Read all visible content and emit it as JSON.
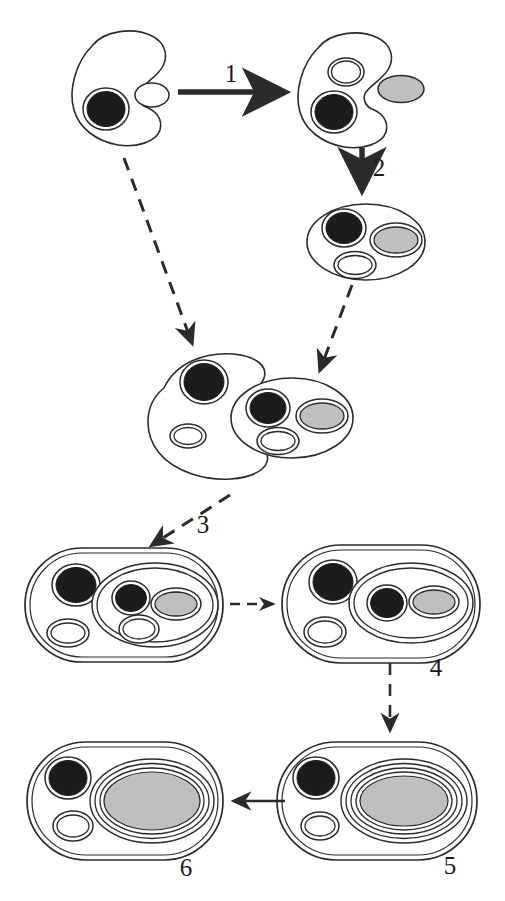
{
  "figure": {
    "background_color": "#ffffff",
    "outline_color": "#2b2b2b",
    "nucleus_color": "#1c1c1c",
    "plastid_color": "#bfbfbf",
    "vesicle_color": "#ffffff",
    "arrow_color": "#2b2b2b"
  },
  "step_labels": [
    {
      "id": "step-1",
      "text": "1",
      "x": 231,
      "y": 82
    },
    {
      "id": "step-2",
      "text": "2",
      "x": 379,
      "y": 176
    },
    {
      "id": "step-3",
      "text": "3",
      "x": 203,
      "y": 533
    },
    {
      "id": "step-4",
      "text": "4",
      "x": 436,
      "y": 676
    },
    {
      "id": "step-5",
      "text": "5",
      "x": 450,
      "y": 874
    },
    {
      "id": "step-6",
      "text": "6",
      "x": 186,
      "y": 876
    }
  ],
  "cells": [
    {
      "id": "cell-host-initial",
      "name": "host-cell-initial",
      "stage": "start",
      "shape": "crescent",
      "organelles": [
        "nucleus-dark",
        "vesicle-white"
      ]
    },
    {
      "id": "cell-host-with-prey",
      "name": "host-cell-approaching-alga",
      "stage": "after-step-1",
      "shape": "crescent",
      "organelles": [
        "nucleus-dark",
        "vesicle-white",
        "external-gray-body"
      ]
    },
    {
      "id": "cell-primary-alga",
      "name": "primary-alga-cell",
      "stage": "after-step-2",
      "shape": "oval",
      "organelles": [
        "nucleus-dark",
        "plastid-gray",
        "vesicle-white"
      ]
    },
    {
      "id": "cell-engulfing-host",
      "name": "host-cell-engulfing-alga",
      "stage": "merging",
      "shape": "crescent",
      "organelles": [
        "nucleus-dark",
        "vesicle-white"
      ]
    },
    {
      "id": "cell-engulfed-alga",
      "name": "engulfed-alga-cell",
      "stage": "merging",
      "shape": "oval",
      "organelles": [
        "nucleus-dark",
        "plastid-gray",
        "vesicle-white"
      ]
    },
    {
      "id": "cell-stage-3",
      "name": "cell-stage-three",
      "stage": "3",
      "shape": "rounded-rectangle",
      "organelles": [
        "host-nucleus-dark",
        "host-vesicle-white",
        "endosymbiont-compartment",
        "endosymbiont-nucleus-dark",
        "endosymbiont-plastid-gray",
        "endosymbiont-vesicle-white"
      ]
    },
    {
      "id": "cell-stage-4",
      "name": "cell-stage-four",
      "stage": "4",
      "shape": "rounded-rectangle",
      "organelles": [
        "host-nucleus-dark",
        "host-vesicle-white",
        "endosymbiont-compartment",
        "nucleomorph-dark",
        "plastid-gray"
      ]
    },
    {
      "id": "cell-stage-5",
      "name": "cell-stage-five",
      "stage": "5",
      "shape": "rounded-rectangle",
      "membranes_around_plastid": 4,
      "organelles": [
        "host-nucleus-dark",
        "host-vesicle-white",
        "plastid-gray-four-membranes"
      ]
    },
    {
      "id": "cell-stage-6",
      "name": "cell-stage-six",
      "stage": "6",
      "shape": "rounded-rectangle",
      "membranes_around_plastid": 3,
      "organelles": [
        "host-nucleus-dark",
        "host-vesicle-white",
        "plastid-gray-three-membranes"
      ]
    }
  ],
  "arrows": [
    {
      "id": "arrow-1",
      "name": "arrow-step-1",
      "style": "solid-thick",
      "direction": "right"
    },
    {
      "id": "arrow-2",
      "name": "arrow-step-2",
      "style": "solid-thick",
      "direction": "down"
    },
    {
      "id": "arrow-a",
      "name": "arrow-host-to-merge",
      "style": "dashed",
      "direction": "down-right"
    },
    {
      "id": "arrow-b",
      "name": "arrow-alga-to-merge",
      "style": "dashed",
      "direction": "down-left"
    },
    {
      "id": "arrow-3",
      "name": "arrow-step-3",
      "style": "dashed",
      "direction": "down-left"
    },
    {
      "id": "arrow-34",
      "name": "arrow-stage3-to-stage4",
      "style": "dashed-short",
      "direction": "right"
    },
    {
      "id": "arrow-4",
      "name": "arrow-step-4",
      "style": "dashed",
      "direction": "down"
    },
    {
      "id": "arrow-56",
      "name": "arrow-stage5-to-stage6",
      "style": "solid",
      "direction": "left"
    }
  ]
}
